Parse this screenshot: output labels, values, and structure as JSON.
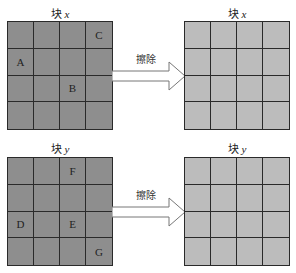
{
  "top": {
    "before": {
      "title_prefix": "块",
      "title_var": "x",
      "cells": [
        "",
        "",
        "",
        "C",
        "A",
        "",
        "",
        "",
        "",
        "",
        "B",
        "",
        "",
        "",
        "",
        ""
      ]
    },
    "arrow_label": "擦除",
    "after": {
      "title_prefix": "块",
      "title_var": "x",
      "cells": [
        "",
        "",
        "",
        "",
        "",
        "",
        "",
        "",
        "",
        "",
        "",
        "",
        "",
        "",
        "",
        ""
      ]
    }
  },
  "bottom": {
    "before": {
      "title_prefix": "块",
      "title_var": "y",
      "cells": [
        "",
        "",
        "F",
        "",
        "",
        "",
        "",
        "",
        "D",
        "",
        "E",
        "",
        "",
        "",
        "",
        "G"
      ]
    },
    "arrow_label": "擦除",
    "after": {
      "title_prefix": "块",
      "title_var": "y",
      "cells": [
        "",
        "",
        "",
        "",
        "",
        "",
        "",
        "",
        "",
        "",
        "",
        "",
        "",
        "",
        "",
        ""
      ]
    }
  },
  "colors": {
    "before_fill": "#8e8e8e",
    "after_fill": "#bcbcbc",
    "line": "#2a2a2a"
  }
}
